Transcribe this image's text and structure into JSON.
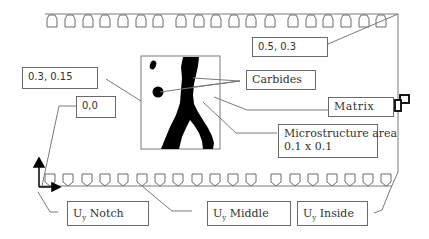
{
  "diagram": {
    "type": "specimen-boundary-conditions",
    "colors": {
      "line": "#7a7a7a",
      "box_border": "#6a6a6a",
      "text": "#333333",
      "fill": "#000000",
      "background": "#ffffff"
    },
    "top_fixture_count": 19,
    "bottom_fixture_count": 19
  },
  "labels": {
    "coord_top_right": "0.5,  0.3",
    "coord_micro": "0.3,  0.15",
    "origin": "0,0",
    "carbides": "Carbides",
    "matrix": "Matrix",
    "micro_line1": "Microstructure area",
    "micro_line2": "0.1 x 0.1",
    "uy_notch": {
      "symbol": "U",
      "sub": "y",
      "text": " Notch"
    },
    "uy_middle": {
      "symbol": "U",
      "sub": "y",
      "text": " Middle"
    },
    "uy_inside": {
      "symbol": "U",
      "sub": "y",
      "text": " Inside"
    }
  }
}
